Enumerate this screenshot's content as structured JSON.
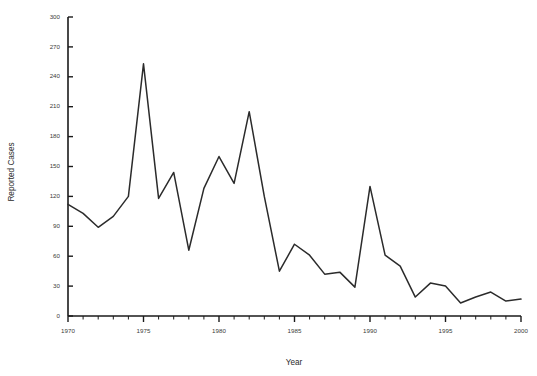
{
  "chart_data": {
    "type": "line",
    "title": "",
    "xlabel": "Year",
    "ylabel": "Reported Cases",
    "x": [
      1970,
      1971,
      1972,
      1973,
      1974,
      1975,
      1976,
      1977,
      1978,
      1979,
      1980,
      1981,
      1982,
      1983,
      1984,
      1985,
      1986,
      1987,
      1988,
      1989,
      1990,
      1991,
      1992,
      1993,
      1994,
      1995,
      1996,
      1997,
      1998,
      1999,
      2000
    ],
    "values": [
      112,
      103,
      89,
      100,
      120,
      253,
      118,
      144,
      66,
      128,
      160,
      133,
      205,
      120,
      45,
      72,
      61,
      42,
      44,
      29,
      130,
      61,
      50,
      19,
      33,
      30,
      13,
      19,
      24,
      15,
      17
    ],
    "series": [
      {
        "name": "Reported Cases",
        "values": [
          112,
          103,
          89,
          100,
          120,
          253,
          118,
          144,
          66,
          128,
          160,
          133,
          205,
          120,
          45,
          72,
          61,
          42,
          44,
          29,
          130,
          61,
          50,
          19,
          33,
          30,
          13,
          19,
          24,
          15,
          17
        ]
      }
    ],
    "xlim": [
      1970,
      2000
    ],
    "ylim": [
      0,
      300
    ],
    "yticks": [
      0,
      30,
      60,
      90,
      120,
      150,
      180,
      210,
      240,
      270,
      300
    ],
    "ytick_labels": [
      "0",
      "30",
      "60",
      "90",
      "120",
      "150",
      "180",
      "210",
      "240",
      "270",
      "300"
    ],
    "xticks": [
      1970,
      1975,
      1980,
      1985,
      1990,
      1995,
      2000
    ],
    "xtick_labels": [
      "1970",
      "1975",
      "1980",
      "1985",
      "1990",
      "1995",
      "2000"
    ],
    "x_minor_step": 1,
    "grid": false,
    "legend": false,
    "legend_position": "none",
    "line_color": "#2b2b2b",
    "axis_color": "#1a1a1a"
  }
}
